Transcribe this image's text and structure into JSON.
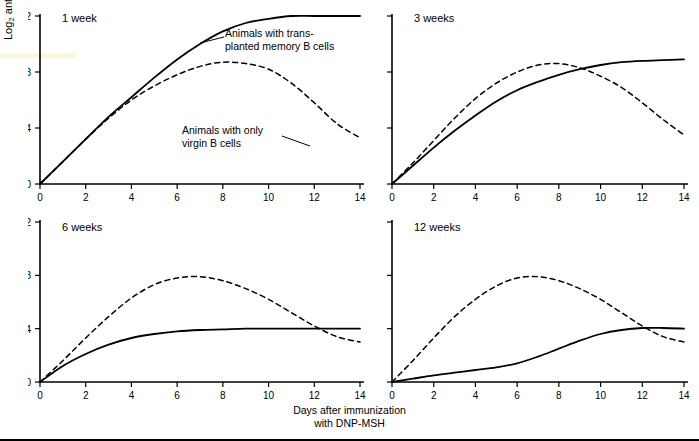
{
  "chart_data": {
    "type": "line",
    "title": "",
    "xlabel": "Days after immunization with DNP-MSH",
    "ylabel": "Log2 anti-DNP titer",
    "xlim": [
      0,
      14
    ],
    "ylim": [
      0,
      12
    ],
    "xticks": [
      0,
      2,
      4,
      6,
      8,
      10,
      12,
      14
    ],
    "yticks": [
      0,
      4,
      8,
      12
    ],
    "grid": false,
    "legend_position": "inline-annotations",
    "series_styles": {
      "memory": "solid",
      "virgin": "dashed"
    },
    "panels": [
      {
        "id": "1week",
        "title": "1 week",
        "x": [
          0,
          1,
          2,
          3,
          4,
          5,
          6,
          7,
          8,
          9,
          10,
          11,
          12,
          13,
          14
        ],
        "series": [
          {
            "name": "Animals with transplanted memory B cells",
            "style": "solid",
            "values": [
              0,
              1.6,
              3.2,
              4.8,
              6.2,
              7.6,
              8.9,
              10.0,
              10.9,
              11.5,
              11.8,
              12.0,
              12.0,
              12.0,
              12.0
            ]
          },
          {
            "name": "Animals with only virgin B cells",
            "style": "dashed",
            "values": [
              0,
              1.6,
              3.2,
              4.7,
              6.0,
              7.0,
              7.8,
              8.4,
              8.7,
              8.6,
              8.2,
              7.2,
              5.8,
              4.3,
              3.3
            ]
          }
        ]
      },
      {
        "id": "3weeks",
        "title": "3 weeks",
        "x": [
          0,
          1,
          2,
          3,
          4,
          5,
          6,
          7,
          8,
          9,
          10,
          11,
          12,
          13,
          14
        ],
        "series": [
          {
            "name": "Animals with transplanted memory B cells",
            "style": "solid",
            "values": [
              0,
              1.3,
              2.6,
              3.8,
              4.9,
              5.9,
              6.7,
              7.3,
              7.8,
              8.2,
              8.5,
              8.7,
              8.8,
              8.85,
              8.9
            ]
          },
          {
            "name": "Animals with only virgin B cells",
            "style": "dashed",
            "values": [
              0,
              1.5,
              3.1,
              4.7,
              6.1,
              7.2,
              8.0,
              8.5,
              8.6,
              8.3,
              7.7,
              6.9,
              5.8,
              4.6,
              3.5
            ]
          }
        ]
      },
      {
        "id": "6weeks",
        "title": "6 weeks",
        "x": [
          0,
          1,
          2,
          3,
          4,
          5,
          6,
          7,
          8,
          9,
          10,
          11,
          12,
          13,
          14
        ],
        "series": [
          {
            "name": "Animals with transplanted memory B cells",
            "style": "solid",
            "values": [
              0,
              1.2,
              2.1,
              2.8,
              3.3,
              3.6,
              3.8,
              3.9,
              3.95,
              4.0,
              4.0,
              4.0,
              4.0,
              4.0,
              4.0
            ]
          },
          {
            "name": "Animals with only virgin B cells",
            "style": "dashed",
            "values": [
              0,
              1.6,
              3.3,
              4.9,
              6.3,
              7.3,
              7.8,
              7.9,
              7.6,
              7.0,
              6.2,
              5.2,
              4.2,
              3.4,
              3.0
            ]
          }
        ]
      },
      {
        "id": "12weeks",
        "title": "12 weeks",
        "x": [
          0,
          1,
          2,
          3,
          4,
          5,
          6,
          7,
          8,
          9,
          10,
          11,
          12,
          13,
          14
        ],
        "series": [
          {
            "name": "Animals with transplanted memory B cells",
            "style": "solid",
            "values": [
              0,
              0.25,
              0.5,
              0.7,
              0.9,
              1.1,
              1.4,
              1.9,
              2.5,
              3.1,
              3.6,
              3.9,
              4.05,
              4.05,
              4.0
            ]
          },
          {
            "name": "Animals with only virgin B cells",
            "style": "dashed",
            "values": [
              0,
              1.6,
              3.3,
              4.9,
              6.2,
              7.2,
              7.8,
              7.9,
              7.6,
              7.0,
              6.2,
              5.2,
              4.2,
              3.4,
              3.0
            ]
          }
        ]
      }
    ],
    "annotations": [
      {
        "id": "memory-label",
        "text": "Animals with trans-\nplanted memory B cells"
      },
      {
        "id": "virgin-label",
        "text": "Animals with only\nvirgin B cells"
      }
    ]
  },
  "axes": {
    "y_label_main": "Log",
    "y_label_sub": "2",
    "y_label_rest": " anti-DNP titer",
    "y_ticks": [
      "0",
      "4",
      "8",
      "12"
    ],
    "x_ticks": [
      "0",
      "2",
      "4",
      "6",
      "8",
      "10",
      "12",
      "14"
    ],
    "x_title_line1": "Days after immunization",
    "x_title_line2": "with DNP-MSH"
  },
  "panel_titles": {
    "p1": "1 week",
    "p2": "3 weeks",
    "p3": "6 weeks",
    "p4": "12 weeks"
  }
}
